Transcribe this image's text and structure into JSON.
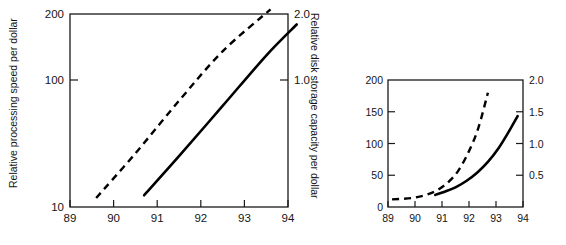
{
  "figure": {
    "title": "",
    "background_color": "#ffffff",
    "ink_color": "#000000"
  },
  "chart_data": [
    {
      "id": "left-panel",
      "type": "line",
      "title": "",
      "xlabel": "",
      "ylabel": "Relative processing speed per dollar",
      "y2label": "Relative disk storage capacity per dollar",
      "yscale": "log",
      "xlim": [
        89,
        94
      ],
      "ylim": [
        10,
        200
      ],
      "y2lim": [
        0.1,
        2.0
      ],
      "grid": false,
      "legend": "none",
      "xticks": [
        "89",
        "90",
        "91",
        "92",
        "93",
        "94"
      ],
      "xtickvalues": [
        89,
        90,
        91,
        92,
        93,
        94
      ],
      "yticks": [
        "10",
        "100",
        "200"
      ],
      "ytickvalues": [
        10,
        100,
        200
      ],
      "y2ticks": [
        "1.0",
        "2.0"
      ],
      "y2tickvalues": [
        1.0,
        2.0
      ],
      "series": [
        {
          "name": "Relative disk storage capacity per dollar",
          "style": "dashed",
          "x": [
            89.6,
            90.5,
            91.5,
            92.5,
            93.6
          ],
          "y": [
            11.5,
            23,
            52,
            112,
            215
          ]
        },
        {
          "name": "Relative processing speed per dollar",
          "style": "solid",
          "x": [
            90.7,
            91.5,
            92.5,
            93.5,
            94.2
          ],
          "y": [
            12,
            22,
            48,
            105,
            170
          ]
        }
      ]
    },
    {
      "id": "right-panel",
      "type": "line",
      "title": "",
      "xlabel": "",
      "ylabel": "",
      "y2label": "",
      "yscale": "linear",
      "xlim": [
        89,
        94
      ],
      "ylim": [
        0,
        200
      ],
      "y2lim": [
        0,
        2.0
      ],
      "grid": false,
      "legend": "none",
      "xticks": [
        "89",
        "90",
        "91",
        "92",
        "93",
        "94"
      ],
      "xtickvalues": [
        89,
        90,
        91,
        92,
        93,
        94
      ],
      "yticks": [
        "0",
        "50",
        "100",
        "150",
        "200"
      ],
      "ytickvalues": [
        0,
        50,
        100,
        150,
        200
      ],
      "y2ticks": [
        "0.5",
        "1.0",
        "1.5",
        "2.0"
      ],
      "y2tickvalues": [
        0.5,
        1.0,
        1.5,
        2.0
      ],
      "series": [
        {
          "name": "Relative disk storage capacity per dollar",
          "style": "dashed",
          "x": [
            89.15,
            89.6,
            90.0,
            90.4,
            90.8,
            91.2,
            91.6,
            92.0,
            92.35,
            92.7
          ],
          "y": [
            12,
            13,
            15,
            19,
            26,
            38,
            57,
            88,
            125,
            180
          ]
        },
        {
          "name": "Relative processing speed per dollar",
          "style": "solid",
          "x": [
            90.75,
            91.1,
            91.5,
            91.9,
            92.3,
            92.7,
            93.1,
            93.45,
            93.8
          ],
          "y": [
            19,
            24,
            31,
            41,
            54,
            71,
            93,
            117,
            143
          ]
        }
      ]
    }
  ],
  "axis_labels": {
    "left_panel_y_title": "Relative processing speed per dollar",
    "left_panel_y2_title": "Relative disk storage capacity per dollar"
  }
}
